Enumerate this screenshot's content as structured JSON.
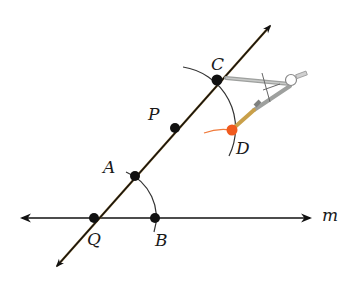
{
  "diagram": {
    "type": "geometric-construction",
    "colors": {
      "line": "#111111",
      "transversal_tint": "#7a5a20",
      "arc": "#333333",
      "point": "#111111",
      "point_D": "#f05a1e",
      "arc_D": "#f07a3a",
      "compass_metal": "#a8aaa8",
      "compass_pencil": "#c9a04a"
    },
    "line_m": {
      "label": "m",
      "y": 218,
      "x1": 20,
      "x2": 312
    },
    "transversal": {
      "x1": 55,
      "y1": 268,
      "x2": 272,
      "y2": 24
    },
    "points": [
      {
        "id": "Q",
        "label": "Q",
        "x": 94,
        "y": 218,
        "label_x": 86,
        "label_y": 232
      },
      {
        "id": "B",
        "label": "B",
        "x": 155,
        "y": 218,
        "label_x": 153,
        "label_y": 232
      },
      {
        "id": "A",
        "label": "A",
        "x": 135,
        "y": 176,
        "label_x": 103,
        "label_y": 159
      },
      {
        "id": "P",
        "label": "P",
        "x": 175,
        "y": 128,
        "label_x": 147,
        "label_y": 106
      },
      {
        "id": "C",
        "label": "C",
        "x": 217,
        "y": 80,
        "label_x": 211,
        "label_y": 55
      },
      {
        "id": "D",
        "label": "D",
        "x": 232,
        "y": 130,
        "label_x": 235,
        "label_y": 140
      }
    ]
  }
}
